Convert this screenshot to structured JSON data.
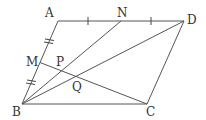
{
  "diagram": {
    "type": "geometry",
    "shape": "parallelogram ABCD",
    "colors": {
      "line": "#555555",
      "label": "#333333",
      "background": "#ffffff"
    },
    "points": {
      "A": {
        "label": "A",
        "x": 58,
        "y": 21
      },
      "D": {
        "label": "D",
        "x": 184,
        "y": 21
      },
      "B": {
        "label": "B",
        "x": 22,
        "y": 104
      },
      "C": {
        "label": "C",
        "x": 147,
        "y": 104
      },
      "M": {
        "label": "M",
        "x": 40,
        "y": 62.5
      },
      "N": {
        "label": "N",
        "x": 121,
        "y": 21
      },
      "P": {
        "label": "P",
        "x": 62,
        "y": 70.7
      },
      "Q": {
        "label": "Q",
        "x": 77,
        "y": 77
      }
    },
    "segments": [
      "AD",
      "AB",
      "BC",
      "CD",
      "BN",
      "BD",
      "MC"
    ],
    "marks": {
      "AN_ND": "single tick (AN = ND)",
      "AM_MB": "double tick (AM = MB)"
    }
  }
}
